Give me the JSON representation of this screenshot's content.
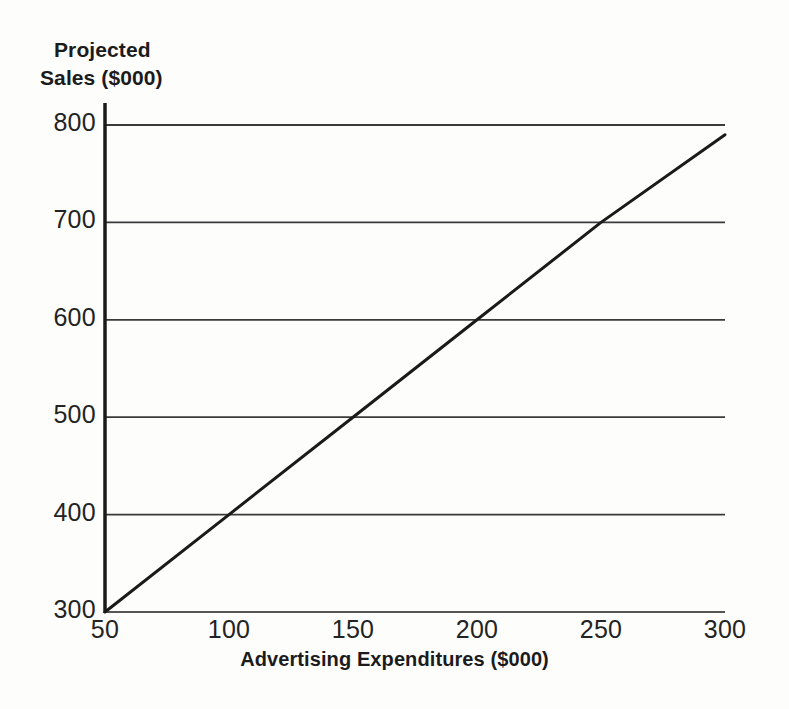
{
  "chart_data": {
    "type": "line",
    "title": "",
    "ylabel": "Projected Sales ($000)",
    "ylabel_lines": [
      "Projected",
      "Sales ($000)"
    ],
    "xlabel": "Advertising Expenditures ($000)",
    "xlim": [
      50,
      300
    ],
    "ylim": [
      300,
      800
    ],
    "xticks": [
      50,
      100,
      150,
      200,
      250,
      300
    ],
    "xtick_labels": [
      "50",
      "100",
      "150",
      "200",
      "250",
      "300"
    ],
    "yticks": [
      300,
      400,
      500,
      600,
      700,
      800
    ],
    "ytick_labels": [
      "300",
      "400",
      "500",
      "600",
      "700",
      "800"
    ],
    "grid": "horizontal",
    "legend": "none",
    "series": [
      {
        "name": "Projected Sales",
        "color": "#1a1a1a",
        "x": [
          50,
          100,
          150,
          200,
          250,
          300
        ],
        "values": [
          300,
          400,
          500,
          600,
          700,
          790
        ]
      }
    ],
    "annotations": []
  },
  "style": {
    "background": "#fdfdfc",
    "axis_color": "#1b1b1b",
    "grid_color": "#3a3a3a",
    "line_color": "#1a1a1a",
    "text_color": "#232323"
  }
}
